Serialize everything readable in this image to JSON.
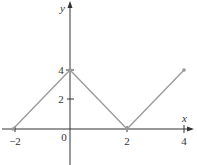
{
  "chart_data": {
    "type": "line",
    "title": "",
    "xlabel": "x",
    "ylabel": "y",
    "x": [
      -2,
      0,
      2,
      4
    ],
    "series": [
      {
        "name": "f(x)",
        "values": [
          0,
          4,
          0,
          4
        ],
        "color": "#999999"
      }
    ],
    "x_ticks": [
      -2,
      0,
      2,
      4
    ],
    "x_tick_labels": [
      "−2",
      "0",
      "2",
      "4"
    ],
    "y_ticks": [
      2,
      4
    ],
    "y_tick_labels": [
      "2",
      "4"
    ],
    "xlim": [
      -2.2,
      4.3
    ],
    "ylim": [
      -2.5,
      9
    ],
    "grid": false,
    "legend": "none",
    "endpoint_markers": true
  },
  "colors": {
    "axis": "#333333",
    "line": "#999999"
  }
}
